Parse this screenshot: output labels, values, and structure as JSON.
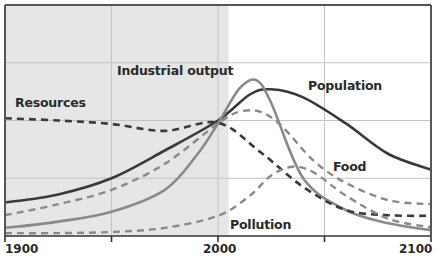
{
  "chart_data": {
    "type": "line",
    "title": "",
    "xlabel": "",
    "ylabel": "",
    "x_range": [
      1900,
      2100
    ],
    "x_ticks": [
      1900,
      1950,
      2000,
      2050,
      2100
    ],
    "x_tick_labels": [
      "1900",
      "",
      "2000",
      "",
      "2100"
    ],
    "y_range": [
      0,
      4
    ],
    "y_gridlines": [
      1,
      2,
      3
    ],
    "grid": true,
    "shaded_region": {
      "from": 1900,
      "to": 2005,
      "color": "#e6e6e6",
      "meaning": "historical period"
    },
    "legend": "inline labels",
    "series": [
      {
        "name": "Population",
        "style": "solid",
        "color": "#3a3a3a",
        "width": 2.6,
        "x": [
          1900,
          1925,
          1950,
          1975,
          2000,
          2015,
          2025,
          2040,
          2060,
          2080,
          2100
        ],
        "values": [
          0.58,
          0.72,
          1.0,
          1.48,
          2.0,
          2.45,
          2.54,
          2.4,
          1.95,
          1.42,
          1.15
        ]
      },
      {
        "name": "Industrial output",
        "style": "solid",
        "color": "#8a8a8a",
        "width": 2.6,
        "x": [
          1900,
          1925,
          1950,
          1975,
          1990,
          2000,
          2010,
          2018,
          2025,
          2040,
          2060,
          2080,
          2100
        ],
        "values": [
          0.14,
          0.25,
          0.42,
          0.8,
          1.4,
          1.95,
          2.55,
          2.7,
          2.3,
          1.0,
          0.45,
          0.22,
          0.1
        ]
      },
      {
        "name": "Food",
        "style": "dashed",
        "color": "#8a8a8a",
        "width": 2.4,
        "x": [
          1900,
          1925,
          1950,
          1975,
          2000,
          2010,
          2020,
          2030,
          2045,
          2060,
          2080,
          2100
        ],
        "values": [
          0.36,
          0.55,
          0.8,
          1.25,
          1.95,
          2.15,
          2.15,
          1.9,
          1.3,
          0.92,
          0.62,
          0.55
        ]
      },
      {
        "name": "Resources",
        "style": "dashed",
        "color": "#3a3a3a",
        "width": 2.6,
        "x": [
          1900,
          1925,
          1950,
          1975,
          2000,
          2020,
          2040,
          2060,
          2080,
          2100
        ],
        "values": [
          2.04,
          2.0,
          1.94,
          1.82,
          1.96,
          1.45,
          0.85,
          0.45,
          0.36,
          0.35
        ]
      },
      {
        "name": "Pollution",
        "style": "dashed",
        "color": "#8a8a8a",
        "width": 2.4,
        "x": [
          1900,
          1925,
          1950,
          1975,
          2000,
          2015,
          2025,
          2035,
          2045,
          2060,
          2080,
          2100
        ],
        "values": [
          0.05,
          0.05,
          0.07,
          0.14,
          0.35,
          0.7,
          1.05,
          1.2,
          1.1,
          0.7,
          0.3,
          0.15
        ]
      }
    ],
    "annotations": [
      {
        "text": "Industrial output",
        "x_px": 117,
        "y_px": 63
      },
      {
        "text": "Population",
        "x_px": 308,
        "y_px": 78
      },
      {
        "text": "Resources",
        "x_px": 15,
        "y_px": 95
      },
      {
        "text": "Food",
        "x_px": 333,
        "y_px": 159
      },
      {
        "text": "Pollution",
        "x_px": 230,
        "y_px": 218
      }
    ]
  }
}
